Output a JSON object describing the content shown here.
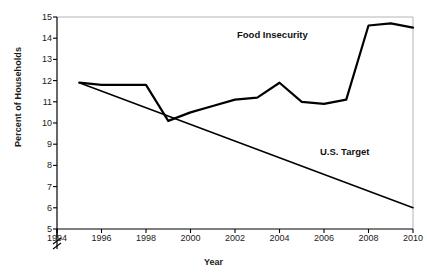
{
  "chart_data": {
    "type": "line",
    "title": "",
    "xlabel": "Year",
    "ylabel": "Percent of Households",
    "xlim": [
      1994,
      2010
    ],
    "ylim": [
      5,
      15
    ],
    "grid": false,
    "legend_position": "inline-annotations",
    "y_axis_break": true,
    "xticks": [
      "1994",
      "1996",
      "1998",
      "2000",
      "2002",
      "2004",
      "2006",
      "2008",
      "2010"
    ],
    "yticks": [
      "5",
      "6",
      "7",
      "8",
      "9",
      "10",
      "11",
      "12",
      "13",
      "14",
      "15"
    ],
    "annotations": [
      {
        "text": "Food Insecurity",
        "x": 2004.6,
        "y": 14.0
      },
      {
        "text": "U.S. Target",
        "x": 2008.2,
        "y": 8.2
      }
    ],
    "x": [
      1995,
      1996,
      1997,
      1998,
      1999,
      2000,
      2001,
      2002,
      2003,
      2004,
      2005,
      2006,
      2007,
      2008,
      2009,
      2010
    ],
    "series": [
      {
        "name": "Food Insecurity",
        "color": "#000000",
        "values": [
          11.9,
          11.8,
          11.8,
          11.8,
          10.1,
          10.5,
          10.8,
          11.1,
          11.2,
          11.9,
          11.0,
          10.9,
          11.1,
          14.6,
          14.7,
          14.5
        ]
      },
      {
        "name": "U.S. Target",
        "color": "#000000",
        "x": [
          1995,
          2010
        ],
        "values": [
          11.9,
          6.0
        ]
      }
    ]
  },
  "axis": {
    "y_title": "Percent of Households",
    "x_title": "Year"
  },
  "colors": {
    "line": "#000000",
    "frame": "#b4b4b4",
    "axis": "#000000",
    "background": "#ffffff"
  }
}
